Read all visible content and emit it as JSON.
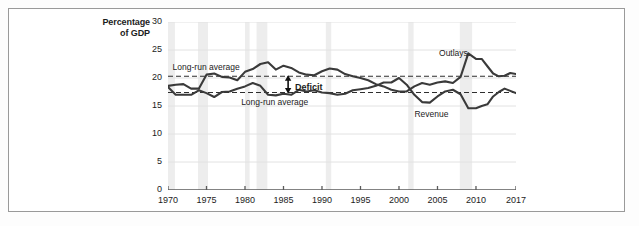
{
  "chart_data": {
    "type": "line",
    "title": "",
    "subtitle": "",
    "xlabel": "",
    "ylabel": "Percentage of GDP",
    "ylabel_line1": "Percentage",
    "ylabel_line2": "of GDP",
    "xlim": [
      1970,
      2017
    ],
    "ylim": [
      0,
      30
    ],
    "yticks": [
      0,
      5,
      10,
      15,
      20,
      25,
      30
    ],
    "xticks": [
      1970,
      1975,
      1980,
      1985,
      1990,
      1995,
      2000,
      2005,
      2010,
      2017
    ],
    "grid": "horizontal",
    "legend": "inline-annotations",
    "x": [
      1970,
      1971,
      1972,
      1973,
      1974,
      1975,
      1976,
      1977,
      1978,
      1979,
      1980,
      1981,
      1982,
      1983,
      1984,
      1985,
      1986,
      1987,
      1988,
      1989,
      1990,
      1991,
      1992,
      1993,
      1994,
      1995,
      1996,
      1997,
      1998,
      1999,
      2000,
      2001,
      2002,
      2003,
      2004,
      2005,
      2006,
      2007,
      2008,
      2009,
      2010,
      2011,
      2012,
      2013,
      2014,
      2015,
      2016,
      2017
    ],
    "series": [
      {
        "name": "Outlays",
        "color": "#3a3a3a",
        "values": [
          18.6,
          18.8,
          18.9,
          18.1,
          18.1,
          20.6,
          20.8,
          20.2,
          20.1,
          19.6,
          21.1,
          21.6,
          22.5,
          22.8,
          21.5,
          22.2,
          21.8,
          21.0,
          20.6,
          20.5,
          21.2,
          21.7,
          21.5,
          20.7,
          20.3,
          20.0,
          19.6,
          18.9,
          18.5,
          17.9,
          17.6,
          17.6,
          18.5,
          19.1,
          18.8,
          19.2,
          19.4,
          19.1,
          20.2,
          24.4,
          23.4,
          23.4,
          22.1,
          20.8,
          20.3,
          20.4,
          20.9,
          20.7
        ]
      },
      {
        "name": "Revenue",
        "color": "#3a3a3a",
        "values": [
          18.4,
          17.0,
          17.0,
          17.0,
          17.8,
          17.3,
          16.6,
          17.5,
          17.6,
          18.1,
          18.5,
          19.1,
          18.6,
          17.0,
          16.9,
          17.2,
          17.0,
          17.9,
          17.6,
          17.8,
          17.4,
          17.3,
          17.0,
          17.2,
          17.8,
          18.0,
          18.2,
          18.6,
          19.2,
          19.2,
          20.0,
          18.8,
          17.0,
          15.7,
          15.6,
          16.7,
          17.6,
          17.9,
          17.1,
          14.6,
          14.6,
          15.0,
          15.3,
          16.7,
          17.5,
          18.1,
          17.7,
          17.3
        ]
      }
    ],
    "reference_lines": [
      {
        "name": "outlays-long-run-average",
        "label": "Long-run average",
        "value": 20.3,
        "style": "dashed"
      },
      {
        "name": "revenue-long-run-average",
        "label": "Long-run average",
        "value": 17.4,
        "style": "dashed"
      }
    ],
    "annotations": [
      {
        "name": "outlays-label",
        "text": "Outlays",
        "x": 2005.2,
        "y": 24.3
      },
      {
        "name": "revenue-label",
        "text": "Revenue",
        "x": 2002.0,
        "y": 13.4
      },
      {
        "name": "deficit-label",
        "text": "Deficit",
        "x": 1986.5,
        "y": 18.3
      },
      {
        "name": "long-run-average-upper",
        "text": "Long-run average",
        "x": 1970.6,
        "y": 21.7
      },
      {
        "name": "long-run-average-lower",
        "text": "Long-run average",
        "x": 1979.5,
        "y": 15.6
      }
    ],
    "deficit_arrow": {
      "x": 1985.6,
      "y_top": 20.3,
      "y_bottom": 17.4
    },
    "recession_bands": [
      {
        "start": 1970.0,
        "end": 1970.9
      },
      {
        "start": 1973.9,
        "end": 1975.2
      },
      {
        "start": 1980.0,
        "end": 1980.6
      },
      {
        "start": 1981.5,
        "end": 1982.9
      },
      {
        "start": 1990.5,
        "end": 1991.2
      },
      {
        "start": 2001.2,
        "end": 2001.9
      },
      {
        "start": 2007.9,
        "end": 2009.5
      }
    ],
    "colors": {
      "line": "#3a3a3a",
      "grid": "#e2e2e2",
      "axis": "#5a5a5a",
      "recession_band": "#ededed",
      "border": "#9a9a9a",
      "background": "#ffffff",
      "page_background": "#fdfdfd",
      "text": "#1c1c1c"
    }
  }
}
